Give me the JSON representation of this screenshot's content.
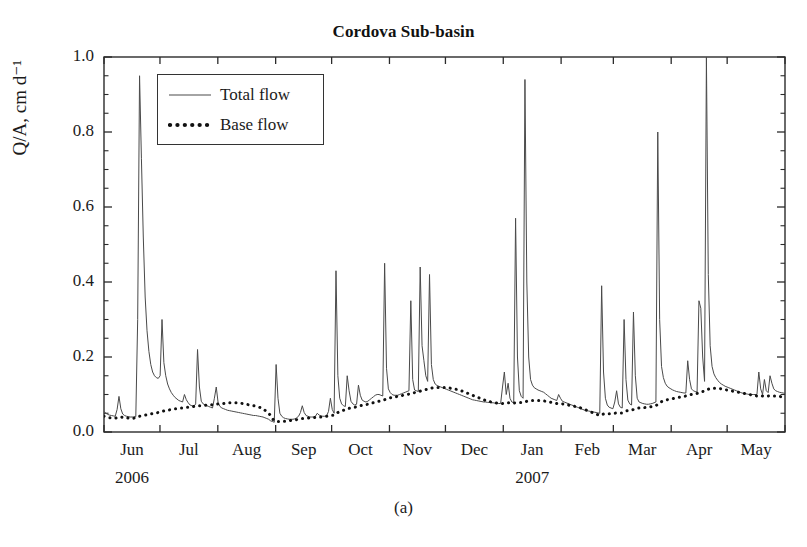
{
  "figure": {
    "panel_caption": "(a)"
  },
  "chart_data": {
    "type": "line",
    "title": "Cordova Sub-basin",
    "xlabel": "",
    "ylabel": "Q/A, cm d⁻¹",
    "ylim": [
      0.0,
      1.0
    ],
    "ytick_labels": [
      "0.0",
      "0.2",
      "0.4",
      "0.6",
      "0.8",
      "1.0"
    ],
    "yticks": [
      0.0,
      0.2,
      0.4,
      0.6,
      0.8,
      1.0
    ],
    "yminor_step": 0.05,
    "grid": false,
    "legend_position": "upper-left-inside",
    "xlim_days": [
      0,
      365
    ],
    "x_tick_labels": [
      "Jun",
      "Jul",
      "Aug",
      "Sep",
      "Oct",
      "Nov",
      "Dec",
      "Jan",
      "Feb",
      "Mar",
      "Apr",
      "May"
    ],
    "x_tick_day_positions": [
      0,
      30,
      61,
      92,
      122,
      153,
      183,
      214,
      245,
      273,
      304,
      334,
      365
    ],
    "x_year_labels": [
      {
        "text": "2006",
        "tick_index": 0
      },
      {
        "text": "2007",
        "tick_index": 7
      }
    ],
    "series": [
      {
        "name": "Total flow",
        "style": "solid-thin",
        "color": "#4a4a4a",
        "linewidth": 1.0,
        "values": [
          0.055,
          0.05,
          0.047,
          0.045,
          0.044,
          0.043,
          0.042,
          0.06,
          0.095,
          0.062,
          0.048,
          0.044,
          0.042,
          0.041,
          0.04,
          0.04,
          0.04,
          0.041,
          0.3,
          0.95,
          0.73,
          0.52,
          0.36,
          0.27,
          0.215,
          0.18,
          0.16,
          0.15,
          0.145,
          0.143,
          0.15,
          0.3,
          0.185,
          0.15,
          0.128,
          0.115,
          0.105,
          0.098,
          0.092,
          0.088,
          0.084,
          0.082,
          0.08,
          0.1,
          0.086,
          0.078,
          0.072,
          0.07,
          0.068,
          0.075,
          0.22,
          0.12,
          0.082,
          0.075,
          0.072,
          0.07,
          0.068,
          0.066,
          0.064,
          0.09,
          0.12,
          0.078,
          0.068,
          0.064,
          0.062,
          0.06,
          0.058,
          0.057,
          0.056,
          0.055,
          0.054,
          0.053,
          0.052,
          0.051,
          0.05,
          0.049,
          0.048,
          0.047,
          0.046,
          0.045,
          0.044,
          0.044,
          0.043,
          0.042,
          0.041,
          0.04,
          0.038,
          0.036,
          0.034,
          0.03,
          0.028,
          0.026,
          0.18,
          0.09,
          0.05,
          0.042,
          0.038,
          0.036,
          0.035,
          0.034,
          0.034,
          0.034,
          0.035,
          0.038,
          0.042,
          0.052,
          0.07,
          0.052,
          0.044,
          0.042,
          0.04,
          0.04,
          0.04,
          0.042,
          0.05,
          0.045,
          0.043,
          0.042,
          0.042,
          0.043,
          0.055,
          0.09,
          0.06,
          0.05,
          0.43,
          0.15,
          0.09,
          0.075,
          0.07,
          0.068,
          0.15,
          0.11,
          0.082,
          0.075,
          0.072,
          0.074,
          0.125,
          0.098,
          0.085,
          0.082,
          0.08,
          0.082,
          0.086,
          0.09,
          0.094,
          0.098,
          0.1,
          0.1,
          0.098,
          0.096,
          0.45,
          0.17,
          0.115,
          0.105,
          0.1,
          0.098,
          0.098,
          0.098,
          0.1,
          0.102,
          0.104,
          0.106,
          0.108,
          0.11,
          0.35,
          0.14,
          0.112,
          0.11,
          0.108,
          0.44,
          0.23,
          0.19,
          0.15,
          0.135,
          0.42,
          0.18,
          0.14,
          0.128,
          0.124,
          0.122,
          0.12,
          0.118,
          0.116,
          0.114,
          0.112,
          0.11,
          0.108,
          0.106,
          0.104,
          0.102,
          0.1,
          0.098,
          0.096,
          0.094,
          0.092,
          0.09,
          0.088,
          0.086,
          0.085,
          0.084,
          0.083,
          0.082,
          0.081,
          0.08,
          0.08,
          0.079,
          0.079,
          0.078,
          0.078,
          0.077,
          0.077,
          0.076,
          0.076,
          0.12,
          0.16,
          0.1,
          0.13,
          0.09,
          0.08,
          0.078,
          0.57,
          0.2,
          0.11,
          0.095,
          0.09,
          0.94,
          0.4,
          0.2,
          0.14,
          0.125,
          0.118,
          0.115,
          0.112,
          0.11,
          0.108,
          0.106,
          0.102,
          0.098,
          0.094,
          0.09,
          0.088,
          0.086,
          0.084,
          0.1,
          0.09,
          0.082,
          0.08,
          0.078,
          0.076,
          0.074,
          0.072,
          0.07,
          0.068,
          0.066,
          0.064,
          0.062,
          0.06,
          0.058,
          0.057,
          0.056,
          0.055,
          0.054,
          0.053,
          0.052,
          0.051,
          0.05,
          0.39,
          0.16,
          0.09,
          0.072,
          0.066,
          0.064,
          0.062,
          0.08,
          0.11,
          0.075,
          0.066,
          0.064,
          0.3,
          0.14,
          0.085,
          0.075,
          0.072,
          0.32,
          0.15,
          0.09,
          0.08,
          0.078,
          0.076,
          0.075,
          0.074,
          0.074,
          0.075,
          0.076,
          0.078,
          0.08,
          0.8,
          0.3,
          0.175,
          0.145,
          0.13,
          0.122,
          0.118,
          0.115,
          0.112,
          0.11,
          0.108,
          0.107,
          0.106,
          0.105,
          0.104,
          0.104,
          0.19,
          0.14,
          0.115,
          0.11,
          0.108,
          0.107,
          0.35,
          0.33,
          0.2,
          0.135,
          1.0,
          0.42,
          0.23,
          0.175,
          0.155,
          0.145,
          0.138,
          0.132,
          0.128,
          0.125,
          0.122,
          0.12,
          0.118,
          0.116,
          0.114,
          0.112,
          0.11,
          0.108,
          0.106,
          0.104,
          0.103,
          0.102,
          0.101,
          0.1,
          0.1,
          0.1,
          0.1,
          0.1,
          0.16,
          0.115,
          0.1,
          0.14,
          0.11,
          0.105,
          0.15,
          0.13,
          0.115,
          0.11,
          0.108,
          0.106,
          0.105,
          0.104,
          0.103
        ]
      },
      {
        "name": "Base flow",
        "style": "dotted-thick",
        "color": "#111111",
        "linewidth": 3.0,
        "marker_every_days": 5,
        "values": [
          0.042,
          0.04,
          0.039,
          0.038,
          0.038,
          0.037,
          0.037,
          0.038,
          0.04,
          0.04,
          0.039,
          0.038,
          0.038,
          0.037,
          0.037,
          0.037,
          0.037,
          0.038,
          0.04,
          0.042,
          0.043,
          0.044,
          0.045,
          0.046,
          0.047,
          0.048,
          0.049,
          0.05,
          0.051,
          0.052,
          0.053,
          0.055,
          0.056,
          0.057,
          0.058,
          0.059,
          0.06,
          0.061,
          0.062,
          0.062,
          0.063,
          0.064,
          0.064,
          0.065,
          0.066,
          0.066,
          0.067,
          0.067,
          0.068,
          0.068,
          0.069,
          0.07,
          0.07,
          0.071,
          0.071,
          0.072,
          0.072,
          0.073,
          0.073,
          0.074,
          0.074,
          0.075,
          0.075,
          0.076,
          0.076,
          0.077,
          0.077,
          0.078,
          0.078,
          0.078,
          0.078,
          0.078,
          0.077,
          0.077,
          0.076,
          0.075,
          0.074,
          0.073,
          0.072,
          0.071,
          0.07,
          0.069,
          0.068,
          0.066,
          0.064,
          0.062,
          0.058,
          0.054,
          0.05,
          0.044,
          0.036,
          0.03,
          0.028,
          0.028,
          0.028,
          0.028,
          0.029,
          0.029,
          0.03,
          0.03,
          0.031,
          0.031,
          0.032,
          0.033,
          0.034,
          0.035,
          0.036,
          0.036,
          0.037,
          0.037,
          0.038,
          0.038,
          0.038,
          0.039,
          0.04,
          0.04,
          0.04,
          0.041,
          0.041,
          0.042,
          0.043,
          0.044,
          0.045,
          0.045,
          0.048,
          0.052,
          0.055,
          0.057,
          0.058,
          0.059,
          0.061,
          0.063,
          0.064,
          0.065,
          0.066,
          0.067,
          0.069,
          0.07,
          0.071,
          0.072,
          0.073,
          0.074,
          0.075,
          0.077,
          0.078,
          0.08,
          0.081,
          0.082,
          0.083,
          0.084,
          0.086,
          0.088,
          0.09,
          0.091,
          0.092,
          0.093,
          0.094,
          0.095,
          0.096,
          0.097,
          0.098,
          0.099,
          0.1,
          0.101,
          0.103,
          0.104,
          0.105,
          0.106,
          0.107,
          0.109,
          0.111,
          0.112,
          0.113,
          0.114,
          0.116,
          0.117,
          0.118,
          0.118,
          0.119,
          0.119,
          0.119,
          0.119,
          0.119,
          0.118,
          0.118,
          0.117,
          0.116,
          0.115,
          0.114,
          0.113,
          0.112,
          0.11,
          0.108,
          0.106,
          0.104,
          0.102,
          0.1,
          0.098,
          0.096,
          0.094,
          0.092,
          0.09,
          0.088,
          0.086,
          0.084,
          0.082,
          0.081,
          0.08,
          0.079,
          0.078,
          0.077,
          0.076,
          0.076,
          0.076,
          0.077,
          0.077,
          0.078,
          0.078,
          0.077,
          0.077,
          0.078,
          0.079,
          0.079,
          0.079,
          0.079,
          0.08,
          0.082,
          0.083,
          0.084,
          0.084,
          0.084,
          0.084,
          0.084,
          0.084,
          0.084,
          0.083,
          0.082,
          0.081,
          0.08,
          0.079,
          0.078,
          0.077,
          0.076,
          0.076,
          0.076,
          0.075,
          0.074,
          0.073,
          0.072,
          0.071,
          0.07,
          0.069,
          0.068,
          0.066,
          0.065,
          0.064,
          0.062,
          0.06,
          0.058,
          0.056,
          0.054,
          0.052,
          0.05,
          0.048,
          0.046,
          0.044,
          0.046,
          0.048,
          0.049,
          0.049,
          0.049,
          0.049,
          0.049,
          0.05,
          0.051,
          0.051,
          0.051,
          0.051,
          0.054,
          0.056,
          0.057,
          0.058,
          0.058,
          0.06,
          0.062,
          0.063,
          0.064,
          0.064,
          0.065,
          0.065,
          0.066,
          0.066,
          0.067,
          0.068,
          0.069,
          0.07,
          0.074,
          0.078,
          0.081,
          0.083,
          0.085,
          0.086,
          0.087,
          0.088,
          0.089,
          0.09,
          0.091,
          0.092,
          0.093,
          0.094,
          0.095,
          0.096,
          0.098,
          0.099,
          0.1,
          0.101,
          0.102,
          0.103,
          0.105,
          0.107,
          0.108,
          0.109,
          0.112,
          0.114,
          0.116,
          0.117,
          0.117,
          0.117,
          0.116,
          0.116,
          0.115,
          0.114,
          0.113,
          0.112,
          0.111,
          0.11,
          0.109,
          0.108,
          0.107,
          0.106,
          0.105,
          0.104,
          0.103,
          0.102,
          0.101,
          0.1,
          0.099,
          0.098,
          0.097,
          0.096,
          0.097,
          0.097,
          0.096,
          0.097,
          0.097,
          0.096,
          0.097,
          0.097,
          0.096,
          0.096,
          0.095,
          0.095,
          0.094,
          0.094,
          0.094
        ]
      }
    ]
  },
  "axes_geometry": {
    "left_px": 104,
    "right_px": 785,
    "top_px": 57,
    "bottom_px": 432
  }
}
